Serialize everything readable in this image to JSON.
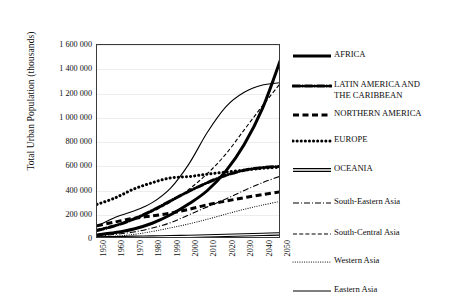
{
  "chart_data": {
    "type": "line",
    "title": "",
    "xlabel": "",
    "ylabel": "Total Urban Population (thousands)",
    "xlim": [
      1950,
      2050
    ],
    "ylim": [
      0,
      1600000
    ],
    "grid": true,
    "legend_position": "right",
    "x": [
      1950,
      1960,
      1970,
      1980,
      1990,
      2000,
      2010,
      2020,
      2030,
      2040,
      2050
    ],
    "xtick_labels": [
      "1950",
      "1960",
      "1970",
      "1980",
      "1990",
      "2000",
      "2010",
      "2020",
      "2030",
      "2040",
      "2050"
    ],
    "ytick_labels": [
      "0",
      "200 000",
      "400 000",
      "600 000",
      "800 000",
      "1 000 000",
      "1 200 000",
      "1 400 000",
      "1 600 000"
    ],
    "ytick_values": [
      0,
      200000,
      400000,
      600000,
      800000,
      1000000,
      1200000,
      1400000,
      1600000
    ],
    "series": [
      {
        "name": "AFRICA",
        "style": "solid-thick",
        "color": "#000000",
        "values": [
          33000,
          53000,
          83000,
          130000,
          200000,
          290000,
          400000,
          560000,
          780000,
          1080000,
          1490000
        ]
      },
      {
        "name": "LATIN AMERICA AND THE CARIBBEAN",
        "style": "dash-dot-thick",
        "color": "#000000",
        "values": [
          70000,
          110000,
          165000,
          235000,
          315000,
          394000,
          465000,
          525000,
          567000,
          590000,
          598000
        ]
      },
      {
        "name": "NORTHERN AMERICA",
        "style": "dashed-thick",
        "color": "#000000",
        "values": [
          110000,
          141000,
          171000,
          190000,
          213000,
          245000,
          282000,
          313000,
          341000,
          367000,
          390000
        ]
      },
      {
        "name": "EUROPE",
        "style": "dotted-thick",
        "color": "#000000",
        "values": [
          285000,
          340000,
          412000,
          464000,
          504000,
          515000,
          535000,
          552000,
          568000,
          583000,
          592000
        ]
      },
      {
        "name": "OCEANIA",
        "style": "double-line",
        "color": "#000000",
        "values": [
          8000,
          11000,
          14000,
          16000,
          19000,
          22000,
          26000,
          30000,
          34000,
          38000,
          42000
        ]
      },
      {
        "name": "South-Eastern Asia",
        "style": "dash-dot-thin",
        "color": "#000000",
        "values": [
          24000,
          38000,
          58000,
          90000,
          135000,
          200000,
          265000,
          330000,
          400000,
          465000,
          520000
        ]
      },
      {
        "name": "South-Central Asia",
        "style": "dashed-thin",
        "color": "#000000",
        "values": [
          80000,
          115000,
          160000,
          225000,
          305000,
          410000,
          540000,
          700000,
          900000,
          1100000,
          1290000
        ]
      },
      {
        "name": "Western Asia",
        "style": "dotted-thin",
        "color": "#000000",
        "values": [
          15000,
          24000,
          38000,
          62000,
          92000,
          125000,
          163000,
          205000,
          245000,
          280000,
          312000
        ]
      },
      {
        "name": "Eastern Asia",
        "style": "solid-thin",
        "color": "#000000",
        "values": [
          105000,
          180000,
          230000,
          300000,
          420000,
          620000,
          880000,
          1090000,
          1210000,
          1270000,
          1290000
        ]
      }
    ]
  },
  "legend": {
    "entries": [
      {
        "label": "AFRICA",
        "style": "solid-thick"
      },
      {
        "label": "LATIN AMERICA AND\nTHE CARIBBEAN",
        "style": "dash-dot-thick"
      },
      {
        "label": "NORTHERN AMERICA",
        "style": "dashed-thick"
      },
      {
        "label": "EUROPE",
        "style": "dotted-thick"
      },
      {
        "label": "OCEANIA",
        "style": "double-line"
      },
      {
        "label": "South-Eastern Asia",
        "style": "dash-dot-thin"
      },
      {
        "label": "South-Central Asia",
        "style": "dashed-thin"
      },
      {
        "label": "Western Asia",
        "style": "dotted-thin"
      },
      {
        "label": "Eastern Asia",
        "style": "solid-thin"
      }
    ]
  }
}
